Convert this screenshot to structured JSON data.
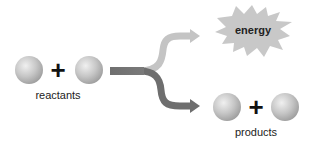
{
  "diagram": {
    "reactants": {
      "label": "reactants",
      "operator": "+"
    },
    "energy": {
      "label": "energy"
    },
    "products": {
      "label": "products",
      "operator": "+"
    },
    "colors": {
      "sphere_light": "#e4e4e4",
      "sphere_mid": "#bdbdbd",
      "sphere_dark": "#9a9a9a",
      "arrow_energy": "#c4c4c4",
      "arrow_products": "#6e6e6e",
      "arrow_stem": "#777777",
      "starburst": "#c8c8c8"
    }
  }
}
